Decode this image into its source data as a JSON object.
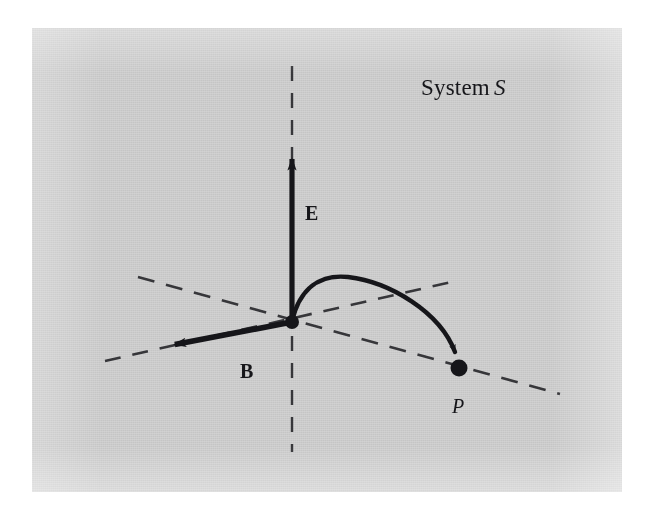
{
  "figure": {
    "domain": "Diagram",
    "kind": "physics-vector-diagram",
    "panel": {
      "background_color": "#d2d2d2",
      "page_color": "#ffffff",
      "ink_color": "#16161a"
    },
    "title_label": {
      "text_plain": "System S",
      "text_prefix": "System",
      "text_italic": "S"
    },
    "labels": {
      "field_E": "E",
      "field_B": "B",
      "point_P": "P"
    },
    "elements": {
      "vertical_axis_name": "vertical dashed axis",
      "depth_axis_name": "dashed depth axis",
      "horizontal_axis_name": "dashed horizontal axis",
      "E_vector_name": "electric field vector",
      "B_vector_name": "magnetic field vector",
      "trajectory_name": "charged particle trajectory arc",
      "origin_name": "origin point",
      "terminal_point_name": "particle end point P"
    }
  },
  "chart_data": {
    "type": "diagram",
    "coordinate_space": {
      "width": 646,
      "height": 515
    },
    "axes": [
      {
        "name": "vertical-dashed-axis",
        "style": "dashed",
        "x1": 292,
        "y1": 66,
        "x2": 292,
        "y2": 452
      },
      {
        "name": "horizontal-dashed-axis",
        "style": "dashed",
        "x1": 138,
        "y1": 277,
        "x2": 560,
        "y2": 394
      },
      {
        "name": "depth-dashed-axis",
        "style": "dashed",
        "x1": 105,
        "y1": 361,
        "x2": 456,
        "y2": 281
      }
    ],
    "vectors": [
      {
        "name": "E",
        "label": "E",
        "from": [
          292,
          322
        ],
        "to": [
          292,
          146
        ],
        "direction": "up",
        "label_pos": [
          305,
          212
        ]
      },
      {
        "name": "B",
        "label": "B",
        "from": [
          292,
          322
        ],
        "to": [
          162,
          347
        ],
        "direction": "left-down",
        "label_pos": [
          240,
          352
        ]
      }
    ],
    "points": [
      {
        "name": "origin",
        "x": 292,
        "y": 322,
        "labeled": false
      },
      {
        "name": "P",
        "x": 459,
        "y": 368,
        "labeled": true,
        "label": "P",
        "label_pos": [
          452,
          392
        ]
      }
    ],
    "trajectory": {
      "name": "particle-path",
      "start": [
        292,
        322
      ],
      "apex": [
        348,
        277
      ],
      "end": [
        459,
        365
      ],
      "arrowhead_at_end": true
    }
  }
}
